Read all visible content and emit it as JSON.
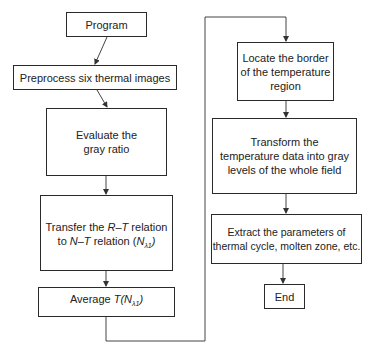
{
  "diagram": {
    "type": "flowchart",
    "nodes": [
      {
        "id": "program",
        "label": "Program"
      },
      {
        "id": "preprocess",
        "label": "Preprocess six thermal images"
      },
      {
        "id": "evaluate",
        "line1": "Evaluate the",
        "line2": "gray ratio"
      },
      {
        "id": "transfer",
        "line1_a": "Transfer the ",
        "line1_b": "R–T",
        "line1_c": " relation",
        "line2_a": "to ",
        "line2_b": "N–T",
        "line2_c": " relation (",
        "line2_d": "N",
        "line2_sub": "λ1",
        "line2_e": ")"
      },
      {
        "id": "average",
        "label_a": "Average ",
        "label_b": "T(N",
        "label_sub": "λ1",
        "label_c": ")"
      },
      {
        "id": "locate",
        "line1": "Locate the border",
        "line2": "of the temperature",
        "line3": "region"
      },
      {
        "id": "transform",
        "line1": "Transform the",
        "line2": "temperature data into gray",
        "line3": "levels of the whole field"
      },
      {
        "id": "extract",
        "line1": "Extract the parameters of",
        "line2": "thermal cycle, molten zone, etc."
      },
      {
        "id": "end",
        "label": "End"
      }
    ],
    "edges": [
      [
        "program",
        "preprocess"
      ],
      [
        "preprocess",
        "evaluate"
      ],
      [
        "evaluate",
        "transfer"
      ],
      [
        "transfer",
        "average"
      ],
      [
        "average",
        "locate"
      ],
      [
        "locate",
        "transform"
      ],
      [
        "transform",
        "extract"
      ],
      [
        "extract",
        "end"
      ]
    ]
  }
}
